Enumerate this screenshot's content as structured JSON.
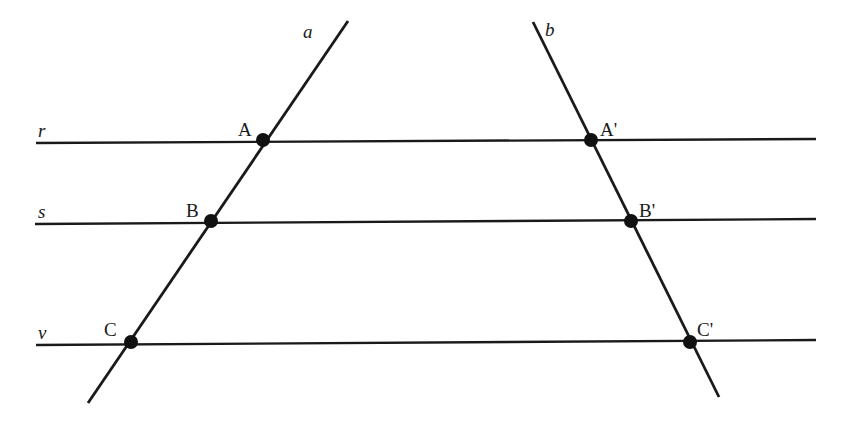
{
  "canvas": {
    "width": 847,
    "height": 421,
    "background": "#ffffff",
    "stroke_color": "#1a1a1a",
    "point_color": "#111111"
  },
  "chart_data": {
    "type": "diagram",
    "title": "",
    "lines": [
      {
        "name": "r",
        "role": "parallel-line",
        "label": "r",
        "label_x": 38,
        "label_y": 121,
        "x1": 36,
        "y1": 143,
        "x2": 816,
        "y2": 139,
        "stroke_width": 2.4
      },
      {
        "name": "s",
        "role": "parallel-line",
        "label": "s",
        "label_x": 38,
        "label_y": 202,
        "x1": 35,
        "y1": 224,
        "x2": 816,
        "y2": 219,
        "stroke_width": 2.4
      },
      {
        "name": "v",
        "role": "parallel-line",
        "label": "v",
        "label_x": 38,
        "label_y": 323,
        "x1": 36,
        "y1": 345,
        "x2": 816,
        "y2": 340,
        "stroke_width": 2.4
      },
      {
        "name": "a",
        "role": "transversal",
        "label": "a",
        "label_x": 303,
        "label_y": 22,
        "x1": 348,
        "y1": 21,
        "x2": 88,
        "y2": 403,
        "stroke_width": 2.8
      },
      {
        "name": "b",
        "role": "transversal",
        "label": "b",
        "label_x": 545,
        "label_y": 20,
        "x1": 533,
        "y1": 22,
        "x2": 719,
        "y2": 397,
        "stroke_width": 2.8
      }
    ],
    "points": [
      {
        "name": "A",
        "label": "A",
        "x": 263,
        "y": 140,
        "label_x": 238,
        "label_y": 120,
        "radius": 7.0,
        "on_lines": [
          "a",
          "r"
        ]
      },
      {
        "name": "B",
        "label": "B",
        "x": 211,
        "y": 221,
        "label_x": 186,
        "label_y": 201,
        "radius": 7.0,
        "on_lines": [
          "a",
          "s"
        ]
      },
      {
        "name": "C",
        "label": "C",
        "x": 131,
        "y": 342,
        "label_x": 104,
        "label_y": 320,
        "radius": 7.0,
        "on_lines": [
          "a",
          "v"
        ]
      },
      {
        "name": "A'",
        "label": "A'",
        "x": 591,
        "y": 140,
        "label_x": 600,
        "label_y": 120,
        "radius": 7.0,
        "on_lines": [
          "b",
          "r"
        ]
      },
      {
        "name": "B'",
        "label": "B'",
        "x": 631,
        "y": 221,
        "label_x": 639,
        "label_y": 201,
        "radius": 7.0,
        "on_lines": [
          "b",
          "s"
        ]
      },
      {
        "name": "C'",
        "label": "C'",
        "x": 690,
        "y": 342,
        "label_x": 697,
        "label_y": 320,
        "radius": 7.0,
        "on_lines": [
          "b",
          "v"
        ]
      }
    ]
  }
}
